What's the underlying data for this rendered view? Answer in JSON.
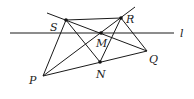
{
  "diagram": {
    "type": "geometry",
    "points": {
      "S": {
        "label": "S",
        "x": 66,
        "y": 20
      },
      "R": {
        "label": "R",
        "x": 121,
        "y": 18
      },
      "M": {
        "label": "M",
        "x": 101,
        "y": 33
      },
      "N": {
        "label": "N",
        "x": 100,
        "y": 62
      },
      "P": {
        "label": "P",
        "x": 43,
        "y": 76
      },
      "Q": {
        "label": "Q",
        "x": 147,
        "y": 51
      }
    },
    "line_l": {
      "label": "l",
      "x1": 10,
      "y1": 33,
      "x2": 174,
      "y2": 33
    },
    "extensions": {
      "SMQ_start": {
        "x": 47,
        "y": 13
      },
      "PMR_end": {
        "x": 135,
        "y": 7
      }
    },
    "segments": [
      [
        "S",
        "R"
      ],
      [
        "P",
        "S"
      ],
      [
        "P",
        "N"
      ],
      [
        "N",
        "Q"
      ],
      [
        "S",
        "N"
      ],
      [
        "R",
        "N"
      ],
      [
        "R",
        "Q"
      ],
      [
        "P",
        "M"
      ],
      [
        "M",
        "R"
      ],
      [
        "S",
        "M"
      ],
      [
        "M",
        "Q"
      ]
    ],
    "colors": {
      "stroke": "#1a1a1a",
      "point": "#111111",
      "label": "#222222"
    }
  }
}
